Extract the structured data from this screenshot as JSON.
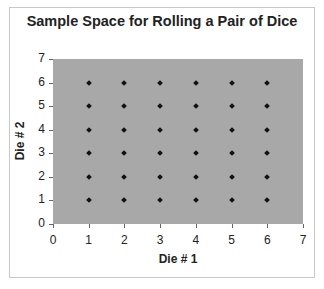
{
  "chart_data": {
    "type": "scatter",
    "title": "Sample Space for Rolling a Pair of Dice",
    "xlabel": "Die # 1",
    "ylabel": "Die # 2",
    "xlim": [
      0,
      7
    ],
    "ylim": [
      0,
      7
    ],
    "x_ticks": [
      "0",
      "1",
      "2",
      "3",
      "4",
      "5",
      "6",
      "7"
    ],
    "y_ticks": [
      "0",
      "1",
      "2",
      "3",
      "4",
      "5",
      "6",
      "7"
    ],
    "grid": false,
    "legend": null,
    "plot_background": "#a8a8a8",
    "marker": "diamond",
    "marker_color": "#111111",
    "points": [
      [
        1,
        1
      ],
      [
        1,
        2
      ],
      [
        1,
        3
      ],
      [
        1,
        4
      ],
      [
        1,
        5
      ],
      [
        1,
        6
      ],
      [
        2,
        1
      ],
      [
        2,
        2
      ],
      [
        2,
        3
      ],
      [
        2,
        4
      ],
      [
        2,
        5
      ],
      [
        2,
        6
      ],
      [
        3,
        1
      ],
      [
        3,
        2
      ],
      [
        3,
        3
      ],
      [
        3,
        4
      ],
      [
        3,
        5
      ],
      [
        3,
        6
      ],
      [
        4,
        1
      ],
      [
        4,
        2
      ],
      [
        4,
        3
      ],
      [
        4,
        4
      ],
      [
        4,
        5
      ],
      [
        4,
        6
      ],
      [
        5,
        1
      ],
      [
        5,
        2
      ],
      [
        5,
        3
      ],
      [
        5,
        4
      ],
      [
        5,
        5
      ],
      [
        5,
        6
      ],
      [
        6,
        1
      ],
      [
        6,
        2
      ],
      [
        6,
        3
      ],
      [
        6,
        4
      ],
      [
        6,
        5
      ],
      [
        6,
        6
      ]
    ]
  }
}
